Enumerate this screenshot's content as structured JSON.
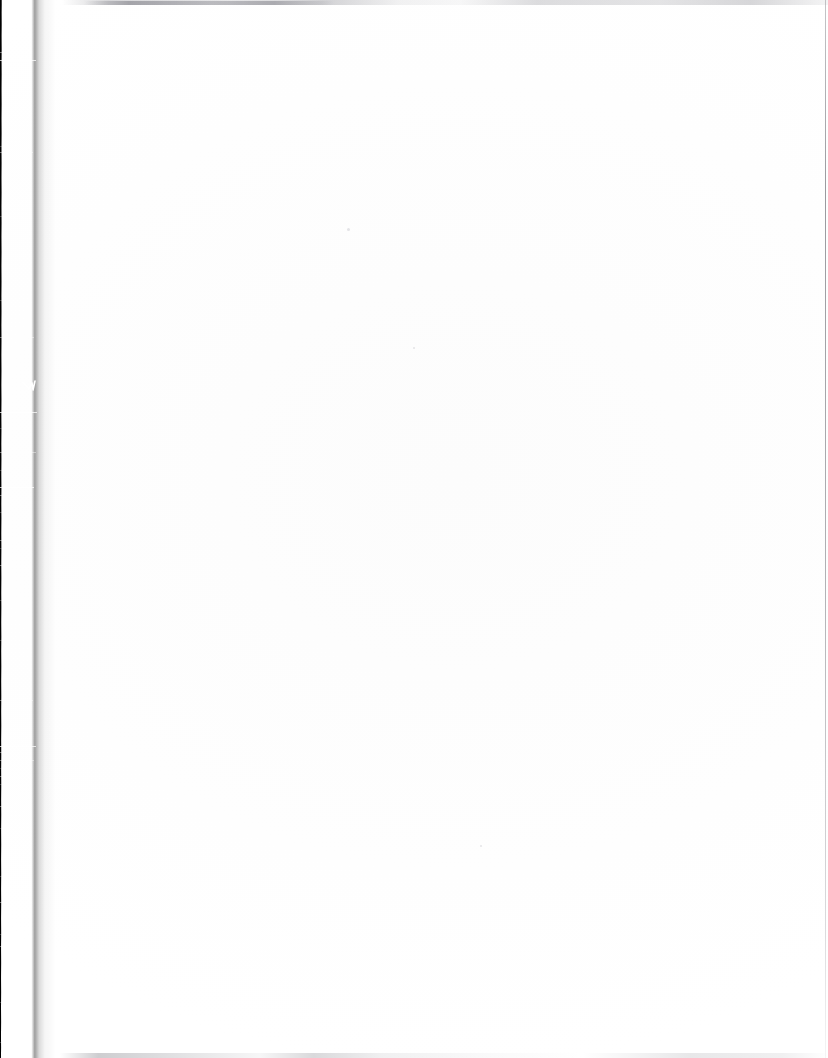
{
  "document": {
    "kind": "scanned-page",
    "page_state": "blank",
    "visible_text": "",
    "caption": ""
  },
  "canvas": {
    "width": 828,
    "height": 1058,
    "paper_color": "#ffffff"
  },
  "artifacts": {
    "gutter_shadow": {
      "name": "gutter-shadow",
      "edge": "left",
      "color": "#000000",
      "width_top_px": 35,
      "width_middle_px": 39,
      "width_bottom_px": 33
    },
    "right_border_line": {
      "name": "page-border-line",
      "edge": "right",
      "color": "#7c7c82"
    },
    "top_streak": {
      "name": "scanner-streak-top",
      "color": "#78787f"
    },
    "bottom_streak": {
      "name": "scanner-streak-bottom",
      "color": "#6e6e76"
    },
    "scratches": [
      {
        "top": 52,
        "left": 0,
        "width": 30,
        "opacity": "soft"
      },
      {
        "top": 60,
        "left": 0,
        "width": 36,
        "opacity": "normal"
      },
      {
        "top": 146,
        "left": 0,
        "width": 26,
        "opacity": "faint"
      },
      {
        "top": 152,
        "left": 0,
        "width": 33,
        "opacity": "soft"
      },
      {
        "top": 216,
        "left": 0,
        "width": 22,
        "opacity": "faint"
      },
      {
        "top": 300,
        "left": 0,
        "width": 18,
        "opacity": "faint"
      },
      {
        "top": 337,
        "left": 0,
        "width": 34,
        "opacity": "soft"
      },
      {
        "top": 412,
        "left": 0,
        "width": 37,
        "opacity": "normal"
      },
      {
        "top": 428,
        "left": 0,
        "width": 25,
        "opacity": "faint"
      },
      {
        "top": 452,
        "left": 0,
        "width": 36,
        "opacity": "soft"
      },
      {
        "top": 470,
        "left": 0,
        "width": 20,
        "opacity": "faint"
      },
      {
        "top": 487,
        "left": 0,
        "width": 34,
        "opacity": "normal"
      },
      {
        "top": 495,
        "left": 0,
        "width": 28,
        "opacity": "soft"
      },
      {
        "top": 512,
        "left": 0,
        "width": 24,
        "opacity": "faint"
      },
      {
        "top": 540,
        "left": 0,
        "width": 30,
        "opacity": "soft"
      },
      {
        "top": 548,
        "left": 0,
        "width": 16,
        "opacity": "faint"
      },
      {
        "top": 565,
        "left": 0,
        "width": 27,
        "opacity": "soft"
      },
      {
        "top": 600,
        "left": 0,
        "width": 21,
        "opacity": "faint"
      },
      {
        "top": 640,
        "left": 0,
        "width": 18,
        "opacity": "faint"
      },
      {
        "top": 700,
        "left": 0,
        "width": 33,
        "opacity": "soft"
      },
      {
        "top": 746,
        "left": 0,
        "width": 36,
        "opacity": "normal"
      },
      {
        "top": 752,
        "left": 0,
        "width": 30,
        "opacity": "soft"
      },
      {
        "top": 760,
        "left": 0,
        "width": 34,
        "opacity": "soft"
      },
      {
        "top": 768,
        "left": 0,
        "width": 26,
        "opacity": "faint"
      },
      {
        "top": 776,
        "left": 0,
        "width": 31,
        "opacity": "soft"
      },
      {
        "top": 784,
        "left": 0,
        "width": 22,
        "opacity": "faint"
      },
      {
        "top": 806,
        "left": 0,
        "width": 29,
        "opacity": "soft"
      },
      {
        "top": 828,
        "left": 0,
        "width": 19,
        "opacity": "faint"
      },
      {
        "top": 876,
        "left": 0,
        "width": 24,
        "opacity": "faint"
      },
      {
        "top": 902,
        "left": 0,
        "width": 32,
        "opacity": "soft"
      },
      {
        "top": 934,
        "left": 0,
        "width": 20,
        "opacity": "faint"
      },
      {
        "top": 946,
        "left": 0,
        "width": 28,
        "opacity": "soft"
      },
      {
        "top": 1002,
        "left": 0,
        "width": 22,
        "opacity": "faint"
      },
      {
        "top": 1042,
        "left": 0,
        "width": 18,
        "opacity": "faint"
      }
    ],
    "specks": [
      {
        "left": 347,
        "top": 228,
        "size": 3
      },
      {
        "left": 480,
        "top": 845,
        "size": 2
      },
      {
        "left": 413,
        "top": 347,
        "size": 2
      }
    ]
  }
}
